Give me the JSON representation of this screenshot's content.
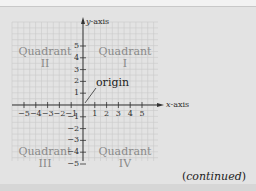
{
  "diagram": {
    "y_axis_label": {
      "var": "y",
      "rest": "-axis"
    },
    "x_axis_label": {
      "var": "x",
      "rest": "-axis"
    },
    "origin_label": "origin",
    "quadrants": [
      {
        "name": "Quadrant",
        "numeral": "II"
      },
      {
        "name": "Quadrant",
        "numeral": "I"
      },
      {
        "name": "Quadrant",
        "numeral": "III"
      },
      {
        "name": "Quadrant",
        "numeral": "IV"
      }
    ],
    "x_ticks": [
      "−5",
      "−4",
      "−3",
      "−2",
      "−1",
      "1",
      "2",
      "3",
      "4",
      "5"
    ],
    "y_ticks": [
      "5",
      "4",
      "3",
      "2",
      "1",
      "−1",
      "−2",
      "−3",
      "−4",
      "−5"
    ],
    "footer": {
      "open": "(",
      "word": "continued",
      "close": ")"
    },
    "colors": {
      "background": "#e3e3e3",
      "grid": "#c9c9c9",
      "axis": "#333333",
      "quadrant_text": "#8a8a8a"
    }
  }
}
